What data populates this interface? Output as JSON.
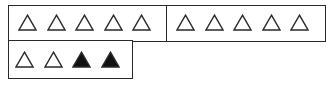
{
  "diagram": {
    "groups": [
      {
        "id": "group-1",
        "triangles": [
          "outline",
          "outline",
          "outline",
          "outline",
          "outline"
        ]
      },
      {
        "id": "group-2",
        "triangles": [
          "outline",
          "outline",
          "outline",
          "outline",
          "outline"
        ]
      },
      {
        "id": "group-3",
        "triangles": [
          "outline",
          "outline",
          "filled",
          "filled"
        ]
      }
    ],
    "counts": {
      "outline": 12,
      "filled": 2,
      "total": 14
    },
    "colors": {
      "stroke": "#2a2a2a",
      "fill_filled": "#111111",
      "fill_outline": "#ffffff"
    }
  }
}
